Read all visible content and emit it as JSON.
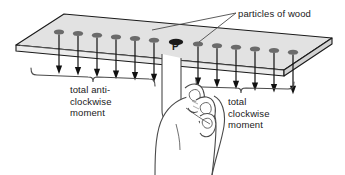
{
  "diagram": {
    "type": "physics-free-body-diagram",
    "background_color": "#ffffff",
    "plank": {
      "name": "wooden plank",
      "top_face_color": "#e2e2e2",
      "side_face_color": "#d2d2d2",
      "front_face_color": "#ececec",
      "outline_color": "#1a1a1a"
    },
    "pivot": {
      "label": "P",
      "description": "pivot particle supported by fingertip",
      "color": "#1a1a1a"
    },
    "particles": {
      "callout_label": "particles of wood",
      "marker_color": "#6b6b6b",
      "left_count": 6,
      "right_count": 6,
      "arrow_color": "#111111",
      "arrow_direction": "down"
    },
    "braces": {
      "left": {
        "line1": "total anti-",
        "line2": "clockwise",
        "line3": "moment"
      },
      "right": {
        "line1": "total",
        "line2": "clockwise",
        "line3": "moment"
      },
      "color": "#4a4a4a"
    },
    "hand": {
      "name": "hand with index finger pointing up",
      "outline_color": "#4a4a4a",
      "fill_color": "#ffffff"
    },
    "leader_lines": {
      "color": "#4a4a4a",
      "count": 2
    }
  }
}
